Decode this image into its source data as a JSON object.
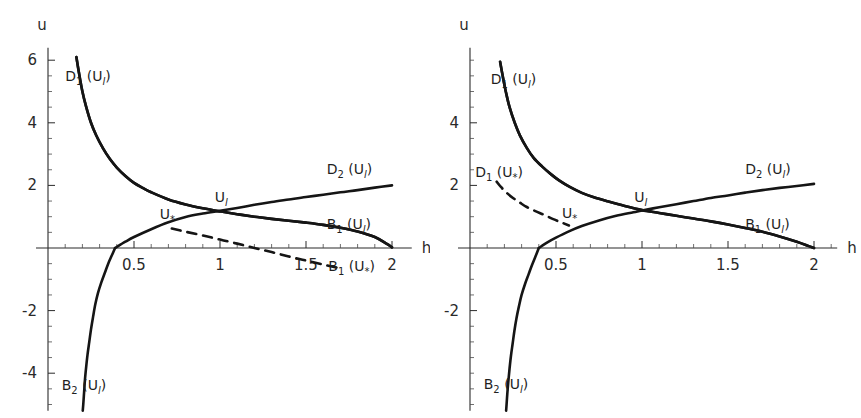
{
  "figure": {
    "width": 861,
    "height": 418,
    "background": "#ffffff",
    "ink_color": "#151515",
    "panel_count": 2
  },
  "chart_data": [
    {
      "id": "left-panel",
      "type": "line",
      "title": "",
      "xlabel": "h",
      "ylabel": "u",
      "xlim": [
        0,
        2.08
      ],
      "ylim": [
        -5.2,
        6.4
      ],
      "grid": false,
      "legend": "inline-annotations",
      "xticks": [
        0.5,
        1,
        1.5,
        2
      ],
      "xtick_labels": [
        "0.5",
        "1",
        "1.5",
        "2"
      ],
      "yticks": [
        6,
        4,
        2,
        -2,
        -4
      ],
      "ytick_labels": [
        "6",
        "4",
        "2",
        "-2",
        "-4"
      ],
      "series": [
        {
          "name": "D1(Ul)",
          "label": "D",
          "label_sub": "1",
          "label_arg": "U",
          "label_arg_sub": "l",
          "style": "solid",
          "label_x": 0.1,
          "label_y": 5.35,
          "formula": "u = 1/h  (branch scaled: u = 1/h)",
          "points": [
            [
              0.165,
              6.1
            ],
            [
              0.18,
              5.6
            ],
            [
              0.2,
              5.0
            ],
            [
              0.22,
              4.55
            ],
            [
              0.25,
              4.0
            ],
            [
              0.28,
              3.6
            ],
            [
              0.32,
              3.18
            ],
            [
              0.36,
              2.84
            ],
            [
              0.4,
              2.57
            ],
            [
              0.45,
              2.3
            ],
            [
              0.5,
              2.08
            ],
            [
              0.55,
              1.92
            ],
            [
              0.6,
              1.78
            ],
            [
              0.7,
              1.55
            ],
            [
              0.8,
              1.39
            ],
            [
              0.9,
              1.27
            ],
            [
              1.0,
              1.17
            ],
            [
              1.1,
              1.08
            ],
            [
              1.2,
              1.0
            ],
            [
              1.3,
              0.93
            ],
            [
              1.4,
              0.87
            ],
            [
              1.5,
              0.81
            ],
            [
              1.6,
              0.74
            ],
            [
              1.7,
              0.65
            ],
            [
              1.8,
              0.53
            ],
            [
              1.9,
              0.35
            ],
            [
              1.97,
              0.13
            ],
            [
              2.0,
              0.02
            ]
          ]
        },
        {
          "name": "D2(Ul)",
          "label": "D",
          "label_sub": "2",
          "label_arg": "U",
          "label_arg_sub": "l",
          "style": "solid",
          "label_x": 1.62,
          "label_y": 2.35,
          "formula": "increasing branch through Ul",
          "points": [
            [
              0.39,
              0.0
            ],
            [
              0.45,
              0.2
            ],
            [
              0.5,
              0.35
            ],
            [
              0.6,
              0.6
            ],
            [
              0.7,
              0.82
            ],
            [
              0.8,
              0.99
            ],
            [
              0.9,
              1.1
            ],
            [
              1.0,
              1.19
            ],
            [
              1.1,
              1.28
            ],
            [
              1.2,
              1.38
            ],
            [
              1.3,
              1.47
            ],
            [
              1.4,
              1.55
            ],
            [
              1.5,
              1.63
            ],
            [
              1.6,
              1.7
            ],
            [
              1.7,
              1.78
            ],
            [
              1.8,
              1.85
            ],
            [
              1.9,
              1.93
            ],
            [
              2.0,
              2.0
            ]
          ]
        },
        {
          "name": "B1(Ul)",
          "label": "B",
          "label_sub": "1",
          "label_arg": "U",
          "label_arg_sub": "l",
          "style": "solid",
          "label_x": 1.62,
          "label_y": 0.62,
          "formula": "decreasing branch through Ul reaching zero at h=2",
          "points": [
            [
              0.165,
              6.1
            ],
            [
              0.18,
              5.6
            ],
            [
              0.2,
              5.0
            ],
            [
              0.22,
              4.55
            ],
            [
              0.25,
              4.0
            ],
            [
              0.28,
              3.6
            ],
            [
              0.32,
              3.18
            ],
            [
              0.36,
              2.84
            ],
            [
              0.4,
              2.57
            ],
            [
              0.45,
              2.3
            ],
            [
              0.5,
              2.08
            ],
            [
              0.55,
              1.92
            ],
            [
              0.6,
              1.78
            ],
            [
              0.7,
              1.55
            ],
            [
              0.8,
              1.39
            ],
            [
              0.9,
              1.27
            ],
            [
              1.0,
              1.17
            ],
            [
              1.1,
              1.08
            ],
            [
              1.2,
              1.0
            ],
            [
              1.3,
              0.93
            ],
            [
              1.4,
              0.87
            ],
            [
              1.5,
              0.81
            ],
            [
              1.6,
              0.74
            ],
            [
              1.7,
              0.65
            ],
            [
              1.8,
              0.53
            ],
            [
              1.9,
              0.35
            ],
            [
              1.97,
              0.13
            ],
            [
              2.0,
              0.02
            ]
          ]
        },
        {
          "name": "B2(Ul)",
          "label": "B",
          "label_sub": "2",
          "label_arg": "U",
          "label_arg_sub": "l",
          "style": "solid",
          "label_x": 0.08,
          "label_y": -4.55,
          "formula": "lower branch, asymptotic to u-axis",
          "points": [
            [
              0.39,
              0.0
            ],
            [
              0.37,
              -0.25
            ],
            [
              0.35,
              -0.5
            ],
            [
              0.33,
              -0.8
            ],
            [
              0.31,
              -1.1
            ],
            [
              0.29,
              -1.45
            ],
            [
              0.275,
              -1.8
            ],
            [
              0.262,
              -2.2
            ],
            [
              0.25,
              -2.6
            ],
            [
              0.24,
              -3.0
            ],
            [
              0.23,
              -3.4
            ],
            [
              0.222,
              -3.8
            ],
            [
              0.215,
              -4.2
            ],
            [
              0.21,
              -4.6
            ],
            [
              0.205,
              -5.0
            ],
            [
              0.202,
              -5.2
            ]
          ]
        },
        {
          "name": "B1(U*)",
          "label": "B",
          "label_sub": "1",
          "label_arg": "U",
          "label_arg_sub": "*",
          "style": "dashed",
          "label_x": 1.63,
          "label_y": -0.72,
          "formula": "dashed branch from U* descending below axis",
          "points": [
            [
              0.72,
              0.62
            ],
            [
              0.8,
              0.52
            ],
            [
              0.9,
              0.4
            ],
            [
              1.0,
              0.27
            ],
            [
              1.1,
              0.14
            ],
            [
              1.2,
              0.0
            ],
            [
              1.3,
              -0.13
            ],
            [
              1.4,
              -0.27
            ],
            [
              1.5,
              -0.4
            ],
            [
              1.6,
              -0.53
            ],
            [
              1.7,
              -0.65
            ]
          ]
        }
      ],
      "point_labels": [
        {
          "text": "U",
          "sub": "*",
          "x": 0.65,
          "y": 0.93,
          "name": "u-star"
        },
        {
          "text": "U",
          "sub": "l",
          "x": 0.97,
          "y": 1.46,
          "name": "u-left-state"
        }
      ]
    },
    {
      "id": "right-panel",
      "type": "line",
      "title": "",
      "xlabel": "h",
      "ylabel": "u",
      "xlim": [
        0,
        2.1
      ],
      "ylim": [
        -5.2,
        6.4
      ],
      "grid": false,
      "legend": "inline-annotations",
      "xticks": [
        0.5,
        1,
        1.5,
        2
      ],
      "xtick_labels": [
        "0.5",
        "1",
        "1.5",
        "2"
      ],
      "yticks": [
        4,
        2,
        -2
      ],
      "ytick_labels": [
        "4",
        "2",
        "-2"
      ],
      "series": [
        {
          "name": "D1(Ul)",
          "label": "D",
          "label_sub": "1",
          "label_arg": "U",
          "label_arg_sub": "l",
          "style": "solid",
          "label_x": 0.12,
          "label_y": 5.25,
          "formula": "u = 1/h",
          "points": [
            [
              0.175,
              5.95
            ],
            [
              0.19,
              5.5
            ],
            [
              0.21,
              4.95
            ],
            [
              0.23,
              4.5
            ],
            [
              0.26,
              4.0
            ],
            [
              0.29,
              3.6
            ],
            [
              0.33,
              3.2
            ],
            [
              0.37,
              2.88
            ],
            [
              0.42,
              2.6
            ],
            [
              0.47,
              2.36
            ],
            [
              0.52,
              2.15
            ],
            [
              0.58,
              1.95
            ],
            [
              0.65,
              1.76
            ],
            [
              0.72,
              1.62
            ],
            [
              0.8,
              1.49
            ],
            [
              0.9,
              1.34
            ],
            [
              1.0,
              1.21
            ],
            [
              1.1,
              1.12
            ],
            [
              1.2,
              1.03
            ],
            [
              1.3,
              0.94
            ],
            [
              1.4,
              0.85
            ],
            [
              1.5,
              0.75
            ],
            [
              1.6,
              0.64
            ],
            [
              1.7,
              0.52
            ],
            [
              1.8,
              0.37
            ],
            [
              1.9,
              0.2
            ],
            [
              1.97,
              0.06
            ],
            [
              2.0,
              0.0
            ]
          ]
        },
        {
          "name": "D1(U*)",
          "label": "D",
          "label_sub": "1",
          "label_arg": "U",
          "label_arg_sub": "*",
          "style": "dashed",
          "label_x": 0.03,
          "label_y": 2.28,
          "formula": "dashed branch terminating at U*",
          "points": [
            [
              0.155,
              2.12
            ],
            [
              0.18,
              1.95
            ],
            [
              0.21,
              1.78
            ],
            [
              0.25,
              1.6
            ],
            [
              0.29,
              1.45
            ],
            [
              0.33,
              1.31
            ],
            [
              0.38,
              1.18
            ],
            [
              0.43,
              1.06
            ],
            [
              0.48,
              0.93
            ],
            [
              0.53,
              0.82
            ],
            [
              0.575,
              0.72
            ]
          ]
        },
        {
          "name": "D2(Ul)",
          "label": "D",
          "label_sub": "2",
          "label_arg": "U",
          "label_arg_sub": "l",
          "style": "solid",
          "label_x": 1.6,
          "label_y": 2.35,
          "formula": "increasing branch through Ul",
          "points": [
            [
              0.4,
              0.0
            ],
            [
              0.45,
              0.18
            ],
            [
              0.5,
              0.33
            ],
            [
              0.575,
              0.53
            ],
            [
              0.65,
              0.7
            ],
            [
              0.75,
              0.88
            ],
            [
              0.85,
              1.03
            ],
            [
              0.95,
              1.14
            ],
            [
              1.0,
              1.2
            ],
            [
              1.1,
              1.3
            ],
            [
              1.2,
              1.4
            ],
            [
              1.3,
              1.5
            ],
            [
              1.4,
              1.6
            ],
            [
              1.5,
              1.68
            ],
            [
              1.6,
              1.77
            ],
            [
              1.7,
              1.85
            ],
            [
              1.8,
              1.92
            ],
            [
              1.9,
              1.98
            ],
            [
              2.0,
              2.05
            ]
          ]
        },
        {
          "name": "B1(Ul)",
          "label": "B",
          "label_sub": "1",
          "label_arg": "U",
          "label_arg_sub": "l",
          "style": "solid",
          "label_x": 1.6,
          "label_y": 0.62,
          "formula": "decreasing branch reaching zero at h=2",
          "points": [
            [
              0.175,
              5.95
            ],
            [
              0.19,
              5.5
            ],
            [
              0.21,
              4.95
            ],
            [
              0.23,
              4.5
            ],
            [
              0.26,
              4.0
            ],
            [
              0.29,
              3.6
            ],
            [
              0.33,
              3.2
            ],
            [
              0.37,
              2.88
            ],
            [
              0.42,
              2.6
            ],
            [
              0.47,
              2.36
            ],
            [
              0.52,
              2.15
            ],
            [
              0.58,
              1.95
            ],
            [
              0.65,
              1.76
            ],
            [
              0.72,
              1.62
            ],
            [
              0.8,
              1.49
            ],
            [
              0.9,
              1.34
            ],
            [
              1.0,
              1.21
            ],
            [
              1.1,
              1.12
            ],
            [
              1.2,
              1.03
            ],
            [
              1.3,
              0.94
            ],
            [
              1.4,
              0.85
            ],
            [
              1.5,
              0.75
            ],
            [
              1.6,
              0.64
            ],
            [
              1.7,
              0.52
            ],
            [
              1.8,
              0.37
            ],
            [
              1.9,
              0.2
            ],
            [
              1.97,
              0.06
            ],
            [
              2.0,
              0.0
            ]
          ]
        },
        {
          "name": "B2(Ul)",
          "label": "B",
          "label_sub": "2",
          "label_arg": "U",
          "label_arg_sub": "l",
          "style": "solid",
          "label_x": 0.08,
          "label_y": -4.5,
          "formula": "lower branch asymptotic to u-axis",
          "points": [
            [
              0.4,
              0.0
            ],
            [
              0.38,
              -0.28
            ],
            [
              0.36,
              -0.55
            ],
            [
              0.34,
              -0.85
            ],
            [
              0.32,
              -1.15
            ],
            [
              0.3,
              -1.5
            ],
            [
              0.285,
              -1.85
            ],
            [
              0.27,
              -2.25
            ],
            [
              0.258,
              -2.65
            ],
            [
              0.248,
              -3.05
            ],
            [
              0.238,
              -3.45
            ],
            [
              0.23,
              -3.85
            ],
            [
              0.223,
              -4.25
            ],
            [
              0.217,
              -4.65
            ],
            [
              0.212,
              -5.05
            ],
            [
              0.21,
              -5.2
            ]
          ]
        }
      ],
      "point_labels": [
        {
          "text": "U",
          "sub": "*",
          "x": 0.535,
          "y": 0.95,
          "name": "u-star"
        },
        {
          "text": "U",
          "sub": "l",
          "x": 0.955,
          "y": 1.47,
          "name": "u-left-state"
        }
      ]
    }
  ]
}
